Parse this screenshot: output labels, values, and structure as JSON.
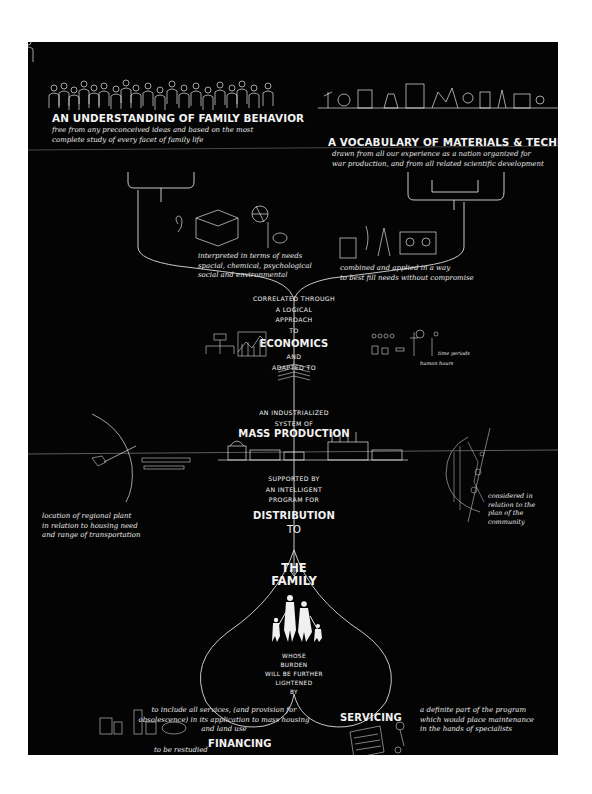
{
  "poster": {
    "background_color": "#040404",
    "ink_color": "#f2f2f2",
    "top_left": {
      "heading": "AN UNDERSTANDING OF FAMILY BEHAVIOR",
      "subtext": [
        "free from any preconceived ideas and based on the most",
        "complete study of every facet of family life"
      ],
      "illustration": "crowd-of-people-icon"
    },
    "top_right": {
      "heading": "A VOCABULARY OF MATERIALS & TECHNIQUES",
      "subtext": [
        "drawn from all our experience as a nation organized for",
        "war production, and from all related scientific development"
      ],
      "illustration": "laboratory-equipment-icon"
    },
    "needs_note": [
      "interpreted in terms of needs",
      "spacial, chemical, psychological",
      "social and environmental"
    ],
    "materials_note": [
      "combined and applied in a way",
      "to best fill needs without compromise"
    ],
    "correlated": [
      "CORRELATED THROUGH",
      "A LOGICAL",
      "APPROACH",
      "TO"
    ],
    "economics": {
      "heading": "ECONOMICS",
      "after": [
        "AND",
        "ADAPTED TO"
      ],
      "sketch_labels": [
        "human hours",
        "time periods"
      ]
    },
    "industrialized": [
      "AN INDUSTRIALIZED",
      "SYSTEM OF"
    ],
    "mass_production": "MASS PRODUCTION",
    "supported": [
      "SUPPORTED BY",
      "AN INTELLIGENT",
      "PROGRAM FOR"
    ],
    "distribution": {
      "heading": "DISTRIBUTION",
      "to": "TO"
    },
    "left_note": [
      "location of regional plant",
      "in relation to housing need",
      "and range of transportation"
    ],
    "right_note": [
      "considered in",
      "relation to the",
      "plan of the",
      "community"
    ],
    "family": {
      "heading": [
        "THE",
        "FAMILY"
      ],
      "illustration": "family-figures-icon",
      "burden": [
        "WHOSE",
        "BURDEN",
        "WILL BE FURTHER",
        "LIGHTENED",
        "BY"
      ]
    },
    "financing": {
      "heading": "FINANCING",
      "note": [
        "to be restudied",
        "to include all services, (and provision for",
        "obsolescence) in its application to mass housing",
        "and land use"
      ]
    },
    "servicing": {
      "heading": "SERVICING",
      "note": [
        "a definite part of the program",
        "which would place maintenance",
        "in the hands of specialists"
      ]
    }
  }
}
